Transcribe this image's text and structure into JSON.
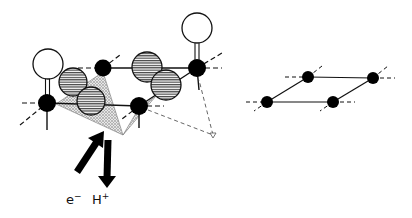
{
  "figure": {
    "left_panel": {
      "description": "Adsorbed molecule on surface with electron and proton transfer",
      "labels": {
        "electron": "e",
        "electron_charge": "−",
        "proton": "H",
        "proton_charge": "+"
      }
    },
    "right_panel": {
      "description": "Bare surface lattice of four atoms"
    },
    "colors": {
      "atom": "#000000",
      "line": "#111111",
      "stripe": "#555555",
      "shade": "#aaaaaa",
      "background": "#ffffff"
    }
  }
}
